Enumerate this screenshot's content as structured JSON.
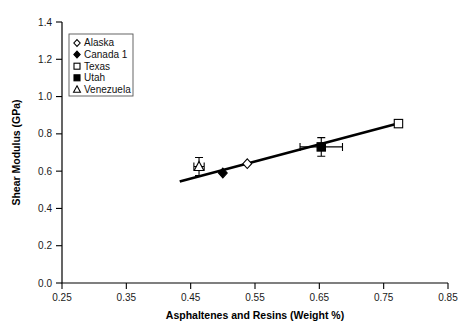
{
  "chart_data": {
    "type": "scatter",
    "title": "",
    "xlabel": "Asphaltenes and Resins (Weight %)",
    "ylabel": "Shear Modulus (GPa)",
    "xlim": [
      0.25,
      0.85
    ],
    "ylim": [
      0.0,
      1.4
    ],
    "xticks": [
      "0.25",
      "0.35",
      "0.45",
      "0.55",
      "0.65",
      "0.75",
      "0.85"
    ],
    "xtick_values": [
      0.25,
      0.35,
      0.45,
      0.55,
      0.65,
      0.75,
      0.85
    ],
    "yticks": [
      "0.0",
      "0.2",
      "0.4",
      "0.6",
      "0.8",
      "1.0",
      "1.2",
      "1.4"
    ],
    "ytick_values": [
      0.0,
      0.2,
      0.4,
      0.6,
      0.8,
      1.0,
      1.2,
      1.4
    ],
    "grid": false,
    "legend_position": "top-left",
    "series": [
      {
        "name": "Alaska",
        "marker": "open-diamond",
        "points": [
          {
            "x": 0.538,
            "y": 0.64
          }
        ]
      },
      {
        "name": "Canada 1",
        "marker": "filled-diamond",
        "points": [
          {
            "x": 0.5,
            "y": 0.59
          }
        ]
      },
      {
        "name": "Texas",
        "marker": "open-square",
        "points": [
          {
            "x": 0.773,
            "y": 0.855
          }
        ]
      },
      {
        "name": "Utah",
        "marker": "filled-square",
        "points": [
          {
            "x": 0.653,
            "y": 0.73,
            "xerr": 0.033,
            "yerr": 0.05
          }
        ]
      },
      {
        "name": "Venezuela",
        "marker": "open-triangle",
        "points": [
          {
            "x": 0.463,
            "y": 0.625,
            "xerr": 0.008,
            "yerr": 0.048
          }
        ]
      }
    ],
    "trendline": {
      "name": "linear-fit",
      "x_start": 0.433,
      "y_start": 0.545,
      "x_end": 0.775,
      "y_end": 0.858
    }
  }
}
